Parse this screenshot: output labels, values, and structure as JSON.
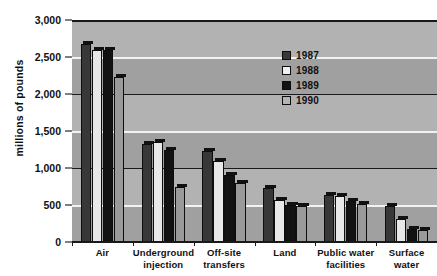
{
  "chart_data": {
    "type": "bar",
    "title": "",
    "xlabel": "",
    "ylabel": "millions of pounds",
    "ylim": [
      0,
      3000
    ],
    "ytick_values": [
      0,
      500,
      1000,
      1500,
      2000,
      2500,
      3000
    ],
    "ytick_labels": [
      "0",
      "500",
      "1,000",
      "1,500",
      "2,000",
      "2,500",
      "3,000"
    ],
    "grid": true,
    "legend_position": "upper-right-inside",
    "categories": [
      "Air",
      "Underground injection",
      "Off-site transfers",
      "Land",
      "Public water facilities",
      "Surface water"
    ],
    "category_label_lines": [
      [
        "Air"
      ],
      [
        "Underground",
        "injection"
      ],
      [
        "Off-site",
        "transfers"
      ],
      [
        "Land"
      ],
      [
        "Public water",
        "facilities"
      ],
      [
        "Surface",
        "water"
      ]
    ],
    "series": [
      {
        "name": "1987",
        "color": "#383838",
        "values": [
          2670,
          1330,
          1230,
          730,
          640,
          490
        ]
      },
      {
        "name": "1988",
        "color": "#e8e8e8",
        "values": [
          2600,
          1350,
          1100,
          570,
          620,
          310
        ]
      },
      {
        "name": "1989",
        "color": "#121212",
        "values": [
          2590,
          1250,
          900,
          500,
          560,
          170
        ]
      },
      {
        "name": "1990",
        "color": "#9a9a9a",
        "values": [
          2230,
          740,
          800,
          490,
          520,
          160
        ]
      }
    ]
  },
  "legend": {
    "entries": [
      {
        "label": "1987",
        "swatch_class": "sw-1987"
      },
      {
        "label": "1988",
        "swatch_class": "sw-1988"
      },
      {
        "label": "1989",
        "swatch_class": "sw-1989"
      },
      {
        "label": "1990",
        "swatch_class": "sw-1990"
      }
    ]
  },
  "axis": {
    "y_title": "millions of pounds"
  },
  "style": {
    "plot_background": "#a8a8a8",
    "band_light": "#b2b2b2",
    "band_dark": "#a0a0a0",
    "gridline_white": "#f2f2f2",
    "gridline_black": "#17191a",
    "text_color": "#111111"
  }
}
